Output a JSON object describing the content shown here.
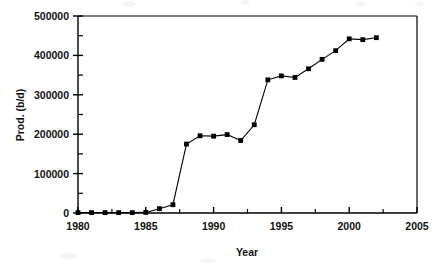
{
  "chart_data": {
    "type": "line",
    "title": "",
    "subtitle": "",
    "xlabel": "Year",
    "ylabel": "Prod. (b/d)",
    "xlim": [
      1980,
      2005
    ],
    "ylim": [
      0,
      500000
    ],
    "x_major_ticks": [
      1980,
      1985,
      1990,
      1995,
      2000,
      2005
    ],
    "x_major_tick_labels": [
      "1980",
      "1985",
      "1990",
      "1995",
      "2000",
      "2005"
    ],
    "x_minor_tick_interval": 2.5,
    "y_major_ticks": [
      0,
      100000,
      200000,
      300000,
      400000,
      500000
    ],
    "y_major_tick_labels": [
      "0",
      "100000",
      "200000",
      "300000",
      "400000",
      "500000"
    ],
    "y_minor_tick_interval": 50000,
    "grid": false,
    "legend": null,
    "legend_position": "none",
    "marker": "square",
    "marker_color": "#000000",
    "line_color": "#000000",
    "series": [
      {
        "name": "Prod. (b/d)",
        "x": [
          1980,
          1981,
          1982,
          1983,
          1984,
          1985,
          1986,
          1987,
          1988,
          1989,
          1990,
          1991,
          1992,
          1993,
          1994,
          1995,
          1996,
          1997,
          1998,
          1999,
          2000,
          2001,
          2002
        ],
        "values": [
          1000,
          1000,
          1000,
          1000,
          1000,
          1500,
          11000,
          21000,
          175000,
          196000,
          195000,
          199000,
          184000,
          224000,
          338000,
          348000,
          344000,
          366000,
          390000,
          412000,
          442000,
          440000,
          445000
        ]
      }
    ]
  },
  "axes": {
    "x_axis_name": "year-axis",
    "y_axis_name": "production-axis"
  }
}
